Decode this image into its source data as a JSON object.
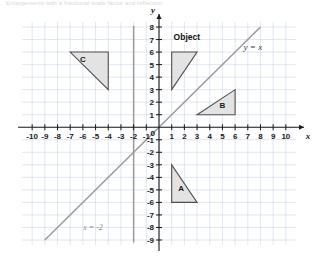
{
  "caption": {
    "text": "Enlargements with a fractional scale factor and reflection"
  },
  "chart_data": {
    "type": "scatter",
    "title": "",
    "xlabel": "x",
    "ylabel": "y",
    "xlim": [
      -10.8,
      10.8
    ],
    "ylim": [
      -9.4,
      8.4
    ],
    "grid": true,
    "legend": "none",
    "x_ticks": [
      -10,
      -9,
      -8,
      -7,
      -6,
      -5,
      -4,
      -3,
      -2,
      -1,
      1,
      2,
      3,
      4,
      5,
      6,
      7,
      8,
      9,
      10
    ],
    "x_tick_labels": [
      "-10",
      "-9",
      "-8",
      "-7",
      "-6",
      "-5",
      "-4",
      "-3",
      "-2",
      "-1",
      "1",
      "2",
      "3",
      "4",
      "5",
      "6",
      "7",
      "8",
      "9",
      "10"
    ],
    "y_ticks": [
      8,
      7,
      6,
      5,
      4,
      3,
      2,
      1,
      -1,
      -2,
      -3,
      -4,
      -5,
      -6,
      -7,
      -8,
      -9
    ],
    "y_tick_labels": [
      "8",
      "7",
      "6",
      "5",
      "4",
      "3",
      "2",
      "1",
      "-1",
      "-2",
      "-3",
      "-4",
      "-5",
      "-6",
      "-7",
      "-8",
      "-9"
    ],
    "shapes": [
      {
        "name": "Object",
        "label": "Object",
        "label_position": "above",
        "label_point": [
          1.15,
          7.0
        ],
        "vertices": [
          [
            1,
            3
          ],
          [
            1,
            6
          ],
          [
            3,
            6
          ]
        ],
        "fill": "#e3e3e3",
        "stroke": "#4f4f4f"
      },
      {
        "name": "A",
        "label": "A",
        "label_position": "inside",
        "label_point": [
          1.75,
          -5.1
        ],
        "vertices": [
          [
            1,
            -3
          ],
          [
            1,
            -6
          ],
          [
            3,
            -6
          ]
        ],
        "fill": "#e3e3e3",
        "stroke": "#4f4f4f"
      },
      {
        "name": "B",
        "label": "B",
        "label_position": "inside",
        "label_point": [
          5.0,
          1.55
        ],
        "vertices": [
          [
            3,
            1
          ],
          [
            6,
            1
          ],
          [
            6,
            3
          ]
        ],
        "fill": "#e3e3e3",
        "stroke": "#4f4f4f"
      },
      {
        "name": "C",
        "label": "C",
        "label_position": "inside",
        "label_point": [
          -6.0,
          5.2
        ],
        "vertices": [
          [
            -7,
            6
          ],
          [
            -4,
            6
          ],
          [
            -4,
            3
          ]
        ],
        "fill": "#e3e3e3",
        "stroke": "#4f4f4f"
      }
    ],
    "lines": [
      {
        "name": "y = x",
        "label": "y = x",
        "label_point": [
          7.4,
          6.2
        ],
        "equation": "y = x",
        "from": [
          -9,
          -9
        ],
        "to": [
          8,
          8
        ],
        "color": "#9a9a9a"
      },
      {
        "name": "x = -2",
        "label": "x = -2",
        "label_point": [
          -5.2,
          -8.2
        ],
        "equation": "x = -2",
        "from": [
          -2,
          -9.2
        ],
        "to": [
          -2,
          8.1
        ],
        "color": "#9a9a9a"
      }
    ],
    "colors": {
      "grid": "#c9d6e8",
      "axis": "#1a1a1a",
      "shape_fill": "#e3e3e3",
      "shape_stroke": "#4f4f4f",
      "construction_line": "#9a9a9a"
    }
  }
}
